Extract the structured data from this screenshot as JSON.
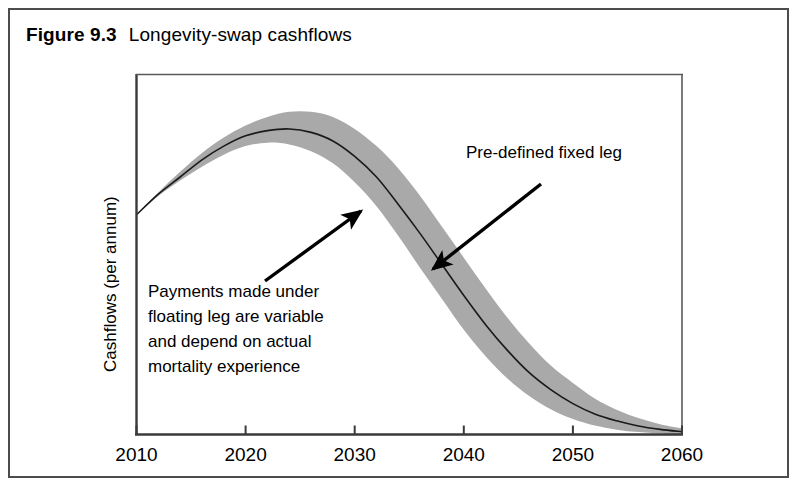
{
  "figure": {
    "label": "Figure 9.3",
    "title": "Longevity-swap cashflows"
  },
  "colors": {
    "frame": "#4c4c4c",
    "axis": "#333333",
    "band_fill": "#a9a9a9",
    "center_line": "#1a1a1a",
    "arrow": "#000000",
    "text": "#000000",
    "background": "#ffffff"
  },
  "annotations": {
    "floating_leg": {
      "lines": [
        "Payments made under",
        "floating leg are variable",
        "and depend on actual",
        "mortality experience"
      ],
      "arrow_from": [
        265,
        281
      ],
      "arrow_to": [
        361,
        211
      ]
    },
    "fixed_leg": {
      "lines": [
        "Pre-defined fixed leg"
      ],
      "arrow_from": [
        541,
        184
      ],
      "arrow_to": [
        433,
        269
      ]
    }
  },
  "chart_data": {
    "type": "area",
    "title": "Longevity-swap cashflows",
    "xlabel": "",
    "ylabel": "Cashflows (per annum)",
    "xlim": [
      2010,
      2060
    ],
    "ylim": [
      0,
      1.05
    ],
    "grid": false,
    "legend": null,
    "xticks": [
      2010,
      2020,
      2030,
      2040,
      2050,
      2060
    ],
    "xtick_labels": [
      "2010",
      "2020",
      "2030",
      "2040",
      "2050",
      "2060"
    ],
    "yticks": [],
    "ytick_labels": [],
    "x": [
      2010,
      2012,
      2014,
      2016,
      2018,
      2020,
      2022,
      2024,
      2026,
      2028,
      2030,
      2032,
      2034,
      2036,
      2038,
      2040,
      2042,
      2044,
      2046,
      2048,
      2050,
      2052,
      2054,
      2056,
      2058,
      2060
    ],
    "series": [
      {
        "name": "Pre-defined fixed leg",
        "role": "center",
        "values": [
          0.64,
          0.7,
          0.75,
          0.8,
          0.84,
          0.87,
          0.885,
          0.89,
          0.88,
          0.855,
          0.81,
          0.75,
          0.67,
          0.585,
          0.495,
          0.405,
          0.32,
          0.245,
          0.18,
          0.13,
          0.09,
          0.06,
          0.04,
          0.025,
          0.015,
          0.008
        ]
      },
      {
        "name": "Floating leg upper bound",
        "role": "band_upper",
        "values": [
          0.64,
          0.705,
          0.765,
          0.82,
          0.865,
          0.9,
          0.925,
          0.94,
          0.94,
          0.925,
          0.89,
          0.84,
          0.775,
          0.695,
          0.605,
          0.515,
          0.425,
          0.34,
          0.265,
          0.2,
          0.15,
          0.105,
          0.072,
          0.048,
          0.03,
          0.018
        ]
      },
      {
        "name": "Floating leg lower bound",
        "role": "band_lower",
        "values": [
          0.64,
          0.695,
          0.74,
          0.78,
          0.815,
          0.84,
          0.85,
          0.845,
          0.825,
          0.79,
          0.735,
          0.665,
          0.578,
          0.485,
          0.395,
          0.305,
          0.228,
          0.163,
          0.112,
          0.073,
          0.045,
          0.026,
          0.014,
          0.007,
          0.003,
          0.0
        ]
      }
    ]
  }
}
